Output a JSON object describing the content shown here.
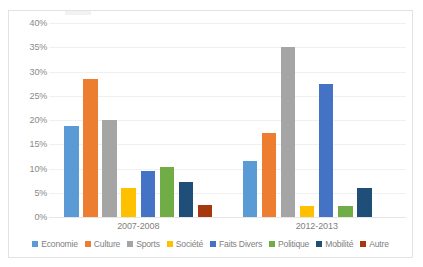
{
  "chart_data": {
    "type": "bar",
    "title": "",
    "subtitle": "",
    "xlabel": "",
    "ylabel": "",
    "categories": [
      "2007-2008",
      "2012-2013"
    ],
    "ylim": [
      0,
      40
    ],
    "ytick_values": [
      40,
      35,
      30,
      25,
      20,
      15,
      10,
      5,
      0
    ],
    "ytick_labels": [
      "40%",
      "35%",
      "30%",
      "25%",
      "20%",
      "15%",
      "10%",
      "5%",
      "0%"
    ],
    "grid": true,
    "legend_position": "bottom",
    "series": [
      {
        "name": "Economie",
        "color": "#5B9BD5",
        "values": [
          18.8,
          11.5
        ]
      },
      {
        "name": "Culture",
        "color": "#ED7D31",
        "values": [
          28.4,
          17.3
        ]
      },
      {
        "name": "Sports",
        "color": "#A5A5A5",
        "values": [
          20.0,
          35.1
        ]
      },
      {
        "name": "Société",
        "color": "#FFC000",
        "values": [
          6.0,
          2.2
        ]
      },
      {
        "name": "Faits Divers",
        "color": "#4472C4",
        "values": [
          9.5,
          27.4
        ]
      },
      {
        "name": "Politique",
        "color": "#70AD47",
        "values": [
          10.4,
          2.2
        ]
      },
      {
        "name": "Mobilité",
        "color": "#1F4E79",
        "values": [
          7.3,
          6.0
        ]
      },
      {
        "name": "Autre",
        "color": "#A6380E",
        "values": [
          2.4,
          0
        ]
      }
    ]
  },
  "colors": {
    "frame_border": "#E2E2E2",
    "gridline": "#F0F0F0",
    "axis_text": "#8A8A8A",
    "legend_text": "#7F7F7F",
    "plot_background": "#FFFFFF"
  }
}
